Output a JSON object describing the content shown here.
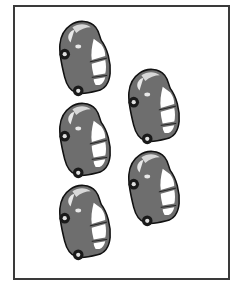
{
  "frame": {
    "border_color": "#3a3a3a",
    "background": "#ffffff"
  },
  "colors": {
    "body": "#6e6e6e",
    "outline": "#111111",
    "window": "#ffffff",
    "highlight": "#d8d8d8",
    "wheel": "#1a1a1a",
    "hubcap": "#e0e0e0"
  },
  "cars": [
    {
      "id": 1,
      "column": "left",
      "x": 57,
      "y": 19
    },
    {
      "id": 2,
      "column": "left",
      "x": 57,
      "y": 101
    },
    {
      "id": 3,
      "column": "left",
      "x": 57,
      "y": 183
    },
    {
      "id": 4,
      "column": "right",
      "x": 126,
      "y": 67
    },
    {
      "id": 5,
      "column": "right",
      "x": 126,
      "y": 149
    }
  ],
  "car_count": 5
}
